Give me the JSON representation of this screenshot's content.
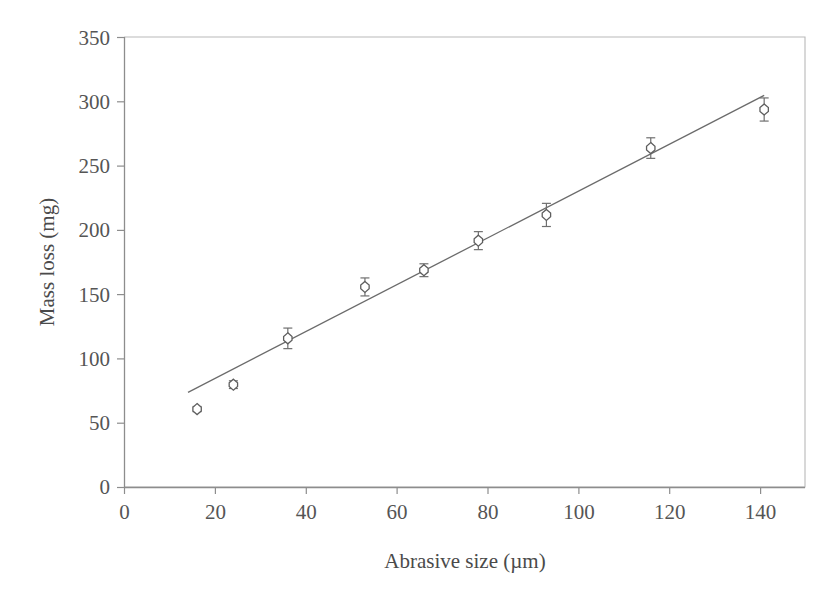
{
  "chart_data": {
    "type": "scatter",
    "title": "",
    "xlabel": "Abrasive size (µm)",
    "ylabel": "Mass loss (mg)",
    "xlim": [
      0,
      150
    ],
    "ylim": [
      0,
      350
    ],
    "xticks": [
      0,
      20,
      40,
      60,
      80,
      100,
      120,
      140
    ],
    "xtick_labels": [
      "0",
      "20",
      "40",
      "60",
      "80",
      "100",
      "120",
      "140"
    ],
    "yticks": [
      0,
      50,
      100,
      150,
      200,
      250,
      300,
      350
    ],
    "ytick_labels": [
      "0",
      "50",
      "100",
      "150",
      "200",
      "250",
      "300",
      "350"
    ],
    "grid": false,
    "legend": null,
    "marker_style": "open-diamond",
    "series": [
      {
        "name": "Mass loss vs abrasive size",
        "x": [
          16,
          24,
          36,
          53,
          66,
          78,
          93,
          116,
          141
        ],
        "y": [
          61,
          80,
          116,
          156,
          169,
          192,
          212,
          264,
          294
        ],
        "yerr": [
          2,
          3,
          8,
          7,
          5,
          7,
          9,
          8,
          9
        ]
      }
    ],
    "trendline": {
      "type": "linear",
      "x": [
        14,
        141
      ],
      "y": [
        74,
        305
      ]
    },
    "colors": {
      "marker_edge": "#5e5e5e",
      "marker_face": "#ffffff",
      "line": "#6b6b6b",
      "axis": "#8d8d8d",
      "frame": "#b9b9b9",
      "text": "#4a4a4a",
      "background": "#ffffff"
    }
  }
}
